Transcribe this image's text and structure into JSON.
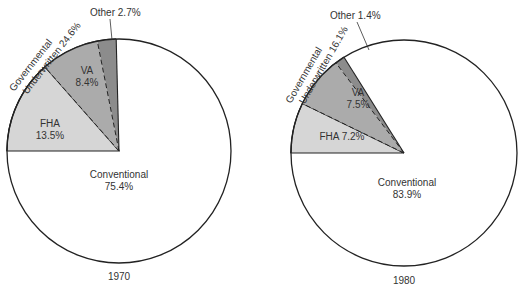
{
  "chart_data": [
    {
      "type": "pie",
      "title": "1970",
      "categories": [
        "Conventional",
        "FHA",
        "VA",
        "Other"
      ],
      "values": [
        75.4,
        13.5,
        8.4,
        2.7
      ],
      "group_annotation": {
        "label": "Governmental Underwritten",
        "value": 24.6,
        "members": [
          "FHA",
          "VA",
          "Other"
        ]
      },
      "colors": {
        "Conventional": "#ffffff",
        "FHA": "#d4d4d4",
        "VA": "#a9a9a9",
        "Other": "#8a8a8a"
      }
    },
    {
      "type": "pie",
      "title": "1980",
      "categories": [
        "Conventional",
        "FHA",
        "VA",
        "Other"
      ],
      "values": [
        83.9,
        7.2,
        7.5,
        1.4
      ],
      "group_annotation": {
        "label": "Governmental Underwritten",
        "value": 16.1,
        "members": [
          "FHA",
          "VA",
          "Other"
        ]
      },
      "colors": {
        "Conventional": "#ffffff",
        "FHA": "#d4d4d4",
        "VA": "#a9a9a9",
        "Other": "#8a8a8a"
      }
    }
  ],
  "pie1970": {
    "year": "1970",
    "conventional_name": "Conventional",
    "conventional_value": "75.4%",
    "fha_name": "FHA",
    "fha_value": "13.5%",
    "va_name": "VA",
    "va_value": "8.4%",
    "other_label": "Other 2.7%",
    "gov_line1": "Governmental",
    "gov_line2": "Underwritten 24.6%"
  },
  "pie1980": {
    "year": "1980",
    "conventional_name": "Conventional",
    "conventional_value": "83.9%",
    "fha_label": "FHA 7.2%",
    "va_name": "VA",
    "va_value": "7.5%",
    "other_label": "Other 1.4%",
    "gov_line1": "Governmental",
    "gov_line2": "Underwritten 16.1%"
  }
}
